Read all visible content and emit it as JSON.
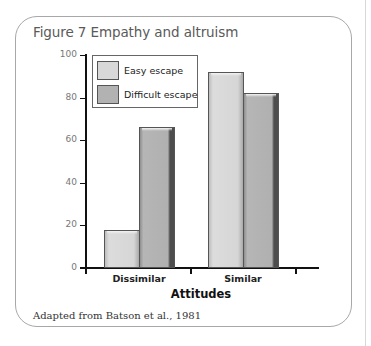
{
  "figure": {
    "title": "Figure 7  Empathy and altruism",
    "source": "Adapted from Batson et al., 1981"
  },
  "colors": {
    "easy_escape": "#d6d6d6",
    "difficult_escape": "#b0b0b0",
    "frame_border": "#a8a8a8",
    "title_text": "#5a5a5a"
  },
  "chart_data": {
    "type": "bar",
    "title": "Figure 7  Empathy and altruism",
    "xlabel": "Attitudes",
    "ylabel": "Percent of participants helping",
    "categories": [
      "Dissimilar",
      "Similar"
    ],
    "series": [
      {
        "name": "Easy escape",
        "values": [
          18,
          92
        ]
      },
      {
        "name": "Difficult escape",
        "values": [
          66,
          82
        ]
      }
    ],
    "ylim": [
      0,
      100
    ],
    "yticks": [
      "0",
      "20",
      "40",
      "60",
      "80",
      "100"
    ],
    "grid": false,
    "legend_position": "upper-left",
    "source": "Adapted from Batson et al., 1981"
  }
}
